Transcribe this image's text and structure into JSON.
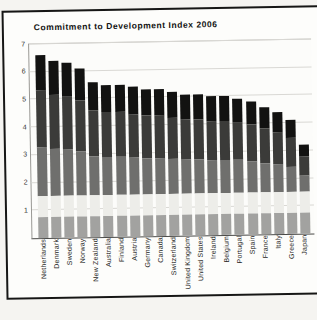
{
  "title": "Commitment to Development Index 2006",
  "chart_data": {
    "type": "bar",
    "stacked": true,
    "title": "Commitment to Development Index 2006",
    "xlabel": "",
    "ylabel": "",
    "ylim": [
      0,
      7
    ],
    "yticks": [
      1,
      2,
      3,
      4,
      5,
      6,
      7
    ],
    "grid": true,
    "legend": "none",
    "categories": [
      "Netherlands",
      "Denmark",
      "Sweden",
      "Norway",
      "New Zealand",
      "Australia",
      "Finland",
      "Austria",
      "Germany",
      "Canada",
      "Switzerland",
      "United Kingdom",
      "United States",
      "Ireland",
      "Belgium",
      "Portugal",
      "Spain",
      "France",
      "Italy",
      "Greece",
      "Japan"
    ],
    "totals": [
      6.6,
      6.4,
      6.3,
      6.1,
      5.6,
      5.5,
      5.5,
      5.4,
      5.3,
      5.3,
      5.2,
      5.1,
      5.1,
      5.0,
      5.0,
      4.9,
      4.8,
      4.6,
      4.4,
      4.1,
      3.2
    ],
    "series": [
      {
        "name": "segment-1-bottom-gray",
        "color": "#a2a2a0",
        "values": [
          0.75,
          0.75,
          0.75,
          0.75,
          0.75,
          0.75,
          0.75,
          0.75,
          0.75,
          0.75,
          0.75,
          0.75,
          0.75,
          0.75,
          0.75,
          0.75,
          0.75,
          0.75,
          0.75,
          0.75,
          0.75
        ]
      },
      {
        "name": "segment-2-light-gray",
        "color": "#edede9",
        "values": [
          0.75,
          0.75,
          0.75,
          0.75,
          0.75,
          0.75,
          0.75,
          0.75,
          0.75,
          0.75,
          0.75,
          0.75,
          0.75,
          0.75,
          0.75,
          0.75,
          0.75,
          0.75,
          0.75,
          0.75,
          0.75
        ]
      },
      {
        "name": "segment-3-mid-gray",
        "color": "#6f6f6d",
        "values": [
          1.8,
          1.71,
          1.68,
          1.61,
          1.43,
          1.4,
          1.4,
          1.36,
          1.33,
          1.33,
          1.29,
          1.26,
          1.26,
          1.22,
          1.22,
          1.19,
          1.15,
          1.08,
          1.01,
          0.91,
          0.6
        ]
      },
      {
        "name": "segment-4-dark-gray",
        "color": "#3b3b39",
        "values": [
          2.04,
          1.96,
          1.92,
          1.84,
          1.64,
          1.6,
          1.6,
          1.56,
          1.52,
          1.52,
          1.48,
          1.44,
          1.44,
          1.4,
          1.4,
          1.36,
          1.32,
          1.24,
          1.16,
          1.04,
          0.68
        ]
      },
      {
        "name": "segment-5-black",
        "color": "#121211",
        "values": [
          1.26,
          1.23,
          1.2,
          1.15,
          1.03,
          1.0,
          1.0,
          0.98,
          0.95,
          0.95,
          0.93,
          0.9,
          0.9,
          0.88,
          0.88,
          0.85,
          0.83,
          0.78,
          0.73,
          0.65,
          0.42
        ]
      }
    ]
  },
  "colors": {
    "page_background": "#f5f4f1",
    "frame_border": "#161615",
    "plot_background": "#fcfcfa",
    "gridline": "#d9d8d4",
    "axis_line": "#4a4a48",
    "text": "#111110"
  }
}
